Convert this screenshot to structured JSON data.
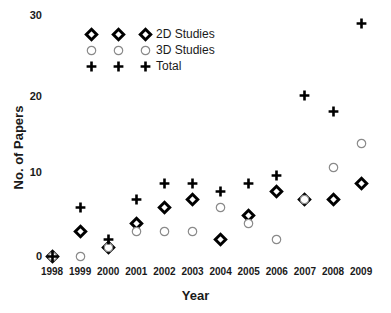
{
  "chart_data": {
    "type": "scatter",
    "title": "",
    "xlabel": "Year",
    "ylabel": "No. of Papers",
    "categories": [
      "1998",
      "1999",
      "2000",
      "2001",
      "2002",
      "2003",
      "2004",
      "2005",
      "2006",
      "2007",
      "2008",
      "2009"
    ],
    "ylim": [
      0,
      30
    ],
    "yticks": [
      0,
      10,
      20,
      30
    ],
    "grid": false,
    "legend_position": "top-left-inside",
    "series": [
      {
        "name": "2D Studies",
        "marker": "diamond-open",
        "color": "#000000",
        "values": [
          0,
          3,
          1,
          4,
          6,
          7,
          2,
          5,
          8,
          7,
          7,
          9
        ]
      },
      {
        "name": "3D Studies",
        "marker": "circle-open",
        "color": "#808080",
        "values": [
          0,
          0,
          1,
          3,
          3,
          3,
          6,
          4,
          2,
          7,
          11,
          14
        ]
      },
      {
        "name": "Total",
        "marker": "plus",
        "color": "#000000",
        "values": [
          0,
          6,
          2,
          7,
          9,
          9,
          8,
          9,
          10,
          20,
          18,
          29
        ]
      }
    ]
  },
  "legend": {
    "rows": [
      {
        "label": "2D Studies",
        "marker": "diamond-open"
      },
      {
        "label": "3D Studies",
        "marker": "circle-open"
      },
      {
        "label": "Total",
        "marker": "plus"
      }
    ]
  },
  "axes": {
    "y_tick_labels": [
      "30",
      "20",
      "10",
      "0"
    ],
    "y_label": "No. of Papers",
    "x_label": "Year"
  }
}
